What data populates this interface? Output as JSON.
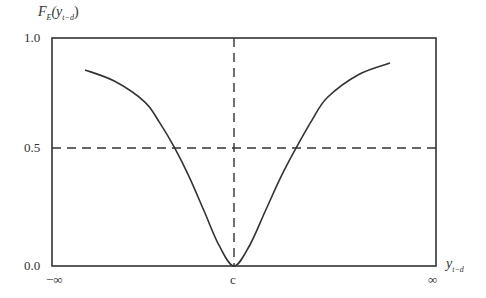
{
  "chart_data": {
    "type": "line",
    "title": "",
    "ylabel": "F_E(y_{t-d})",
    "ylabel_main": "F",
    "ylabel_sub": "E",
    "ylabel_arg": "(y",
    "ylabel_arg_sub": "t−d",
    "ylabel_close": ")",
    "xlabel": "y_{t-d}",
    "xlabel_main": "y",
    "xlabel_sub": "t−d",
    "ylim": [
      0.0,
      1.0
    ],
    "y_ticks": [
      "1.0",
      "0.5",
      "0.0"
    ],
    "x_ticks": [
      "−∞",
      "c",
      "∞"
    ],
    "grid": false,
    "legend": null,
    "reference_lines": [
      {
        "orientation": "horizontal",
        "value": 0.5,
        "style": "dashed"
      },
      {
        "orientation": "vertical",
        "value": "c",
        "style": "dashed"
      }
    ],
    "series": [
      {
        "name": "Exponential transition function F_E",
        "x": [
          -1.0,
          -0.8,
          -0.6,
          -0.5,
          -0.4,
          -0.3,
          -0.2,
          -0.1,
          0.0,
          0.1,
          0.2,
          0.3,
          0.4,
          0.5,
          0.6,
          0.8,
          1.0
        ],
        "values": [
          0.86,
          0.81,
          0.72,
          0.63,
          0.52,
          0.39,
          0.24,
          0.09,
          0.0,
          0.09,
          0.24,
          0.39,
          0.52,
          0.64,
          0.74,
          0.84,
          0.89
        ]
      }
    ]
  }
}
